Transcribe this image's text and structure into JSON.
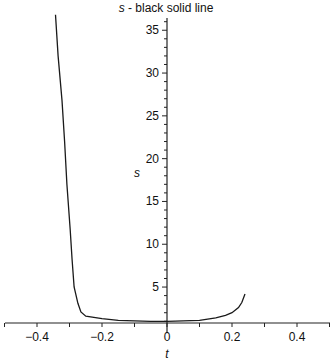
{
  "chart_data": {
    "type": "line",
    "title": "s - black solid line",
    "title_italic_part": "s",
    "title_rest": " - black solid line",
    "xlabel": "t",
    "ylabel": "s",
    "xlim": [
      -0.5,
      0.5
    ],
    "ylim": [
      0.8,
      37
    ],
    "grid": false,
    "legend": null,
    "x_ticks": [
      -0.4,
      -0.2,
      0,
      0.2,
      0.4
    ],
    "x_tick_labels": [
      "-0.4",
      "-0.2",
      "0",
      "0.2",
      "0.4"
    ],
    "y_ticks": [
      5,
      10,
      15,
      20,
      25,
      30,
      35
    ],
    "y_tick_labels": [
      "5",
      "10",
      "15",
      "20",
      "25",
      "30",
      "35"
    ],
    "series": [
      {
        "name": "s",
        "style": "black solid line",
        "color": "#1a1a1a",
        "x": [
          -0.343,
          -0.335,
          -0.323,
          -0.315,
          -0.308,
          -0.298,
          -0.292,
          -0.286,
          -0.274,
          -0.265,
          -0.25,
          -0.2,
          -0.15,
          -0.1,
          -0.05,
          0,
          0.05,
          0.1,
          0.15,
          0.18,
          0.2,
          0.22,
          0.23,
          0.24
        ],
        "y": [
          36.8,
          32.0,
          26.8,
          22.0,
          17.0,
          11.7,
          8.2,
          5.0,
          3.1,
          2.1,
          1.6,
          1.3,
          1.1,
          1.05,
          1.0,
          1.0,
          1.05,
          1.1,
          1.4,
          1.7,
          2.0,
          2.6,
          3.2,
          4.2
        ]
      }
    ]
  }
}
